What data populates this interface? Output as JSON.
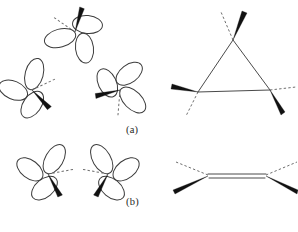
{
  "figure": {
    "type": "chemistry-structure-diagram",
    "background_color": "#ffffff",
    "line_color": "#3b3b3b",
    "wedge_color": "#111111",
    "dash_color": "#6e6e6e",
    "captions": {
      "row_a": "(a)",
      "row_b": "(b)",
      "bottom": ""
    },
    "rows": [
      {
        "id": "row-a",
        "label": "(a)",
        "left_group": {
          "name": "sp2-orbital-triad",
          "count": 3,
          "orbitals": [
            {
              "name": "orbital-top",
              "cx": 75,
              "cy": 32,
              "rotation": -15,
              "lobes": 3,
              "wedge_direction": "up-right",
              "dash_direction": "up-left"
            },
            {
              "name": "orbital-lower-left",
              "cx": 32,
              "cy": 90,
              "rotation": 105,
              "lobes": 3,
              "wedge_direction": "down-left",
              "dash_direction": "left"
            },
            {
              "name": "orbital-lower-right",
              "cx": 120,
              "cy": 90,
              "rotation": -135,
              "lobes": 3,
              "wedge_direction": "down-right",
              "dash_direction": "right"
            }
          ]
        },
        "right_group": {
          "name": "cyclopropane-skeleton",
          "shape": "triangle",
          "vertices": [
            {
              "name": "vertex-top",
              "x": 233,
              "y": 40
            },
            {
              "name": "vertex-bottom-left",
              "x": 200,
              "y": 92
            },
            {
              "name": "vertex-bottom-right",
              "x": 268,
              "y": 90
            }
          ],
          "wedges": [
            {
              "name": "wedge-top",
              "direction": "up-right"
            },
            {
              "name": "wedge-bottom-left",
              "direction": "left"
            },
            {
              "name": "wedge-bottom-right",
              "direction": "down-right"
            }
          ],
          "dashes": [
            {
              "name": "dash-top",
              "direction": "up-left"
            },
            {
              "name": "dash-bottom-left",
              "direction": "down-left"
            },
            {
              "name": "dash-bottom-right",
              "direction": "right"
            }
          ]
        }
      },
      {
        "id": "row-b",
        "label": "(b)",
        "left_group": {
          "name": "sp2-orbital-pair",
          "count": 2,
          "orbitals": [
            {
              "name": "orbital-left",
              "cx": 48,
              "cy": 28,
              "rotation": 120,
              "lobes": 3,
              "wedge_direction": "down-left",
              "dash_direction": "up-left"
            },
            {
              "name": "orbital-right",
              "cx": 108,
              "cy": 28,
              "rotation": -120,
              "lobes": 3,
              "wedge_direction": "down-right",
              "dash_direction": "up-right"
            }
          ]
        },
        "right_group": {
          "name": "alkene-skeleton",
          "shape": "double-bond",
          "bond_order": 2,
          "atoms": [
            {
              "name": "carbon-left",
              "x": 208,
              "y": 30
            },
            {
              "name": "carbon-right",
              "x": 266,
              "y": 30
            }
          ],
          "wedges": [
            {
              "name": "wedge-left",
              "direction": "down-left"
            },
            {
              "name": "wedge-right",
              "direction": "down-right"
            }
          ],
          "dashes": [
            {
              "name": "dash-left",
              "direction": "up-left"
            },
            {
              "name": "dash-right",
              "direction": "up-right"
            }
          ]
        }
      }
    ]
  }
}
